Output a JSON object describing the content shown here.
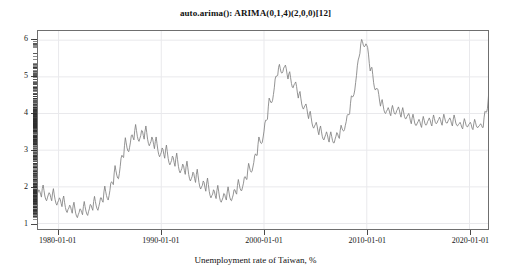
{
  "chart_data": {
    "type": "line",
    "title": "auto.arima(): ARIMA(0,1,4)(2,0,0)[12]",
    "xlabel": "Unemployment rate of Taiwan, %",
    "ylabel": "",
    "grid": true,
    "legend": "none",
    "line_color": "#808080",
    "frame_color": "#6f6f6f",
    "grid_color": "#e9e9ec",
    "background": "#ffffff",
    "xlim": [
      "1978-01-01",
      "2021-10-01"
    ],
    "ylim": [
      0.85,
      6.25
    ],
    "x_tick_labels": [
      "1980-01-01",
      "1990-01-01",
      "2000-01-01",
      "2010-01-01",
      "2020-01-01"
    ],
    "x_tick_values": [
      1980,
      1990,
      2000,
      2010,
      2020
    ],
    "y_tick_labels": [
      "1",
      "2",
      "3",
      "4",
      "5",
      "6"
    ],
    "y_tick_values": [
      1,
      2,
      3,
      4,
      5,
      6
    ],
    "series": [
      {
        "name": "Unemployment rate of Taiwan, %",
        "x_start": 1978.0,
        "x_step": 0.0833333,
        "values": [
          1.85,
          1.92,
          1.88,
          1.8,
          1.72,
          1.95,
          2.05,
          1.9,
          1.75,
          1.66,
          1.62,
          1.7,
          1.78,
          1.84,
          1.8,
          1.7,
          1.62,
          1.83,
          1.95,
          1.78,
          1.65,
          1.55,
          1.5,
          1.58,
          1.62,
          1.7,
          1.66,
          1.55,
          1.46,
          1.66,
          1.75,
          1.58,
          1.44,
          1.34,
          1.3,
          1.38,
          1.42,
          1.5,
          1.46,
          1.36,
          1.28,
          1.48,
          1.58,
          1.42,
          1.28,
          1.2,
          1.16,
          1.24,
          1.3,
          1.4,
          1.38,
          1.3,
          1.24,
          1.46,
          1.6,
          1.46,
          1.34,
          1.26,
          1.22,
          1.32,
          1.4,
          1.52,
          1.5,
          1.42,
          1.36,
          1.6,
          1.74,
          1.6,
          1.48,
          1.4,
          1.36,
          1.46,
          1.56,
          1.7,
          1.7,
          1.62,
          1.58,
          1.86,
          2.02,
          1.88,
          1.76,
          1.68,
          1.64,
          1.76,
          1.9,
          2.1,
          2.14,
          2.1,
          2.06,
          2.38,
          2.58,
          2.44,
          2.32,
          2.24,
          2.22,
          2.36,
          2.55,
          2.78,
          2.86,
          2.82,
          2.8,
          3.12,
          3.34,
          3.2,
          3.06,
          2.98,
          2.96,
          3.08,
          3.22,
          3.4,
          3.42,
          3.34,
          3.28,
          3.54,
          3.7,
          3.54,
          3.38,
          3.28,
          3.24,
          3.32,
          3.4,
          3.54,
          3.52,
          3.4,
          3.3,
          3.52,
          3.66,
          3.48,
          3.3,
          3.18,
          3.12,
          3.18,
          3.24,
          3.36,
          3.3,
          3.16,
          3.04,
          3.24,
          3.36,
          3.18,
          3.0,
          2.88,
          2.82,
          2.88,
          2.94,
          3.06,
          3.02,
          2.88,
          2.78,
          3.0,
          3.14,
          2.96,
          2.78,
          2.66,
          2.6,
          2.66,
          2.72,
          2.84,
          2.8,
          2.66,
          2.56,
          2.78,
          2.92,
          2.74,
          2.56,
          2.44,
          2.38,
          2.44,
          2.5,
          2.62,
          2.58,
          2.44,
          2.34,
          2.56,
          2.7,
          2.52,
          2.34,
          2.22,
          2.16,
          2.22,
          2.28,
          2.4,
          2.36,
          2.22,
          2.12,
          2.34,
          2.48,
          2.3,
          2.12,
          2.0,
          1.94,
          2.0,
          2.04,
          2.16,
          2.12,
          1.98,
          1.88,
          2.1,
          2.24,
          2.06,
          1.88,
          1.76,
          1.7,
          1.76,
          1.8,
          1.92,
          1.88,
          1.76,
          1.68,
          1.9,
          2.04,
          1.88,
          1.72,
          1.62,
          1.58,
          1.64,
          1.7,
          1.82,
          1.8,
          1.7,
          1.64,
          1.86,
          2.0,
          1.86,
          1.72,
          1.64,
          1.62,
          1.7,
          1.78,
          1.92,
          1.92,
          1.84,
          1.8,
          2.04,
          2.2,
          2.08,
          1.96,
          1.9,
          1.9,
          2.0,
          2.1,
          2.26,
          2.28,
          2.22,
          2.2,
          2.46,
          2.64,
          2.54,
          2.44,
          2.4,
          2.42,
          2.54,
          2.66,
          2.84,
          2.9,
          2.86,
          2.86,
          3.16,
          3.36,
          3.28,
          3.2,
          3.18,
          3.22,
          3.36,
          3.52,
          3.74,
          3.82,
          3.82,
          3.84,
          4.18,
          4.42,
          4.36,
          4.3,
          4.3,
          4.36,
          4.52,
          4.7,
          4.94,
          5.02,
          5.02,
          5.04,
          5.26,
          5.34,
          5.22,
          5.12,
          5.1,
          5.14,
          5.24,
          5.28,
          5.32,
          5.22,
          5.06,
          4.94,
          5.08,
          5.14,
          4.98,
          4.82,
          4.72,
          4.7,
          4.78,
          4.82,
          4.86,
          4.74,
          4.56,
          4.42,
          4.54,
          4.6,
          4.42,
          4.26,
          4.16,
          4.12,
          4.18,
          4.22,
          4.26,
          4.14,
          3.98,
          3.86,
          4.0,
          4.06,
          3.9,
          3.74,
          3.64,
          3.6,
          3.66,
          3.7,
          3.76,
          3.66,
          3.52,
          3.42,
          3.58,
          3.66,
          3.52,
          3.38,
          3.3,
          3.28,
          3.36,
          3.42,
          3.5,
          3.42,
          3.3,
          3.22,
          3.4,
          3.5,
          3.38,
          3.26,
          3.2,
          3.2,
          3.3,
          3.38,
          3.48,
          3.44,
          3.36,
          3.32,
          3.54,
          3.68,
          3.6,
          3.54,
          3.52,
          3.56,
          3.68,
          3.78,
          3.94,
          3.98,
          3.96,
          4.0,
          4.28,
          4.48,
          4.46,
          4.46,
          4.52,
          4.64,
          4.84,
          5.04,
          5.3,
          5.46,
          5.54,
          5.64,
          5.9,
          6.02,
          5.96,
          5.86,
          5.82,
          5.84,
          5.9,
          5.86,
          5.8,
          5.62,
          5.36,
          5.16,
          5.24,
          5.26,
          5.06,
          4.84,
          4.7,
          4.64,
          4.68,
          4.68,
          4.66,
          4.52,
          4.34,
          4.2,
          4.32,
          4.38,
          4.24,
          4.1,
          4.02,
          4.0,
          4.06,
          4.1,
          4.16,
          4.1,
          4.0,
          3.94,
          4.12,
          4.22,
          4.12,
          4.02,
          3.98,
          4.0,
          4.08,
          4.12,
          4.18,
          4.1,
          3.98,
          3.9,
          4.06,
          4.16,
          4.04,
          3.92,
          3.86,
          3.86,
          3.92,
          3.96,
          4.0,
          3.92,
          3.8,
          3.72,
          3.88,
          3.98,
          3.86,
          3.74,
          3.68,
          3.68,
          3.74,
          3.78,
          3.84,
          3.78,
          3.68,
          3.62,
          3.8,
          3.92,
          3.82,
          3.72,
          3.68,
          3.7,
          3.78,
          3.82,
          3.88,
          3.82,
          3.72,
          3.66,
          3.84,
          3.96,
          3.86,
          3.76,
          3.72,
          3.74,
          3.8,
          3.84,
          3.9,
          3.84,
          3.74,
          3.68,
          3.86,
          3.98,
          3.88,
          3.78,
          3.74,
          3.74,
          3.8,
          3.84,
          3.88,
          3.82,
          3.72,
          3.66,
          3.84,
          3.96,
          3.86,
          3.74,
          3.68,
          3.66,
          3.7,
          3.72,
          3.76,
          3.7,
          3.62,
          3.58,
          3.74,
          3.86,
          3.78,
          3.68,
          3.64,
          3.64,
          3.7,
          3.72,
          3.76,
          3.7,
          3.6,
          3.56,
          3.72,
          3.84,
          3.76,
          3.66,
          3.62,
          3.62,
          3.66,
          3.68,
          3.72,
          3.68,
          3.62,
          3.62,
          3.88,
          4.06,
          4.04,
          4.04,
          4.14,
          4.42,
          4.8
        ]
      }
    ]
  },
  "axis": {
    "y_labels": [
      "6",
      "5",
      "4",
      "3",
      "2",
      "1"
    ],
    "x_labels": [
      "1980-01-01",
      "1990-01-01",
      "2000-01-01",
      "2010-01-01",
      "2020-01-01"
    ]
  }
}
